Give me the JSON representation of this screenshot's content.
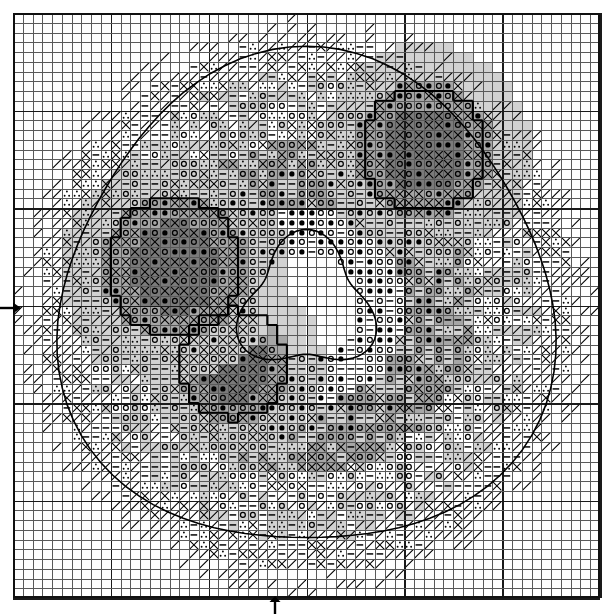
{
  "chart_data": {
    "type": "table",
    "grid": {
      "columns": 60,
      "rows": 60,
      "cell_px": 9.78,
      "bold_every": 10
    },
    "symbol_legend": [
      {
        "key": "blank",
        "glyph": "",
        "name": "empty-stitch"
      },
      {
        "key": "dash",
        "glyph": "—",
        "name": "dash-symbol"
      },
      {
        "key": "circle",
        "glyph": "○",
        "name": "open-circle-symbol"
      },
      {
        "key": "dot",
        "glyph": "●",
        "name": "filled-circle-symbol"
      },
      {
        "key": "cross",
        "glyph": "✕",
        "name": "cross-symbol"
      },
      {
        "key": "slash",
        "glyph": "╱",
        "name": "slash-symbol"
      },
      {
        "key": "trio",
        "glyph": "∴",
        "name": "three-dot-symbol"
      }
    ],
    "shade_legend": [
      {
        "key": 0,
        "hex": "#ffffff",
        "name": "white-background"
      },
      {
        "key": 1,
        "hex": "#d2d2d2",
        "name": "light-gray-background"
      },
      {
        "key": 2,
        "hex": "#a6a6a6",
        "name": "medium-gray-background"
      },
      {
        "key": 3,
        "hex": "#7a7a7a",
        "name": "dark-gray-background"
      }
    ],
    "markers": [
      {
        "name": "center-row-arrow",
        "direction": "right",
        "edge": "left",
        "row": 30
      },
      {
        "name": "center-column-arrow",
        "direction": "up",
        "edge": "bottom",
        "column": 27
      }
    ],
    "colors": {
      "grid_line": "#5a5a5a",
      "bold_grid_line": "#1a1a1a",
      "border": "#111111",
      "symbol": "#000000"
    },
    "rows": [
      "............................................................",
      "..................d.d.d.......ccc.cc........................",
      "................1d1d1d-.......cc.cc.c.......................",
      "...............1-1-1-1-..xxxxxx..ccc........................",
      ".............ooooo--1--1.xxxxx..xxx-........................",
      "............oooooo-1-1..xxx.xxx.xx-.........................",
      "..........ooooox-1-1-1.xx.xxx..xx-1-........................",
      "........--xxxxxx---ttt.xx.xx...x-1-1........................",
      "........----1---tttttt.x......-1-1-1........................",
      ".......-dd---1-ttttttt.......1-1-1-1........................",
      "......d-1-1-1-tttttttxx....xxoxoxox1........................",
      ".....d-1-1-1-1ttttttxxxx..xxxoooooox........................",
      ".....d-1-ooo1-1tttt.xxxxxooooooooooxx.......................",
      "....o-1-ooooo1-1tt.xxxxooooooooooox-........................",
      "...oo1-oooooo1-1-.xxxooooooooooooxx-........................",
      "..ooo1-oooooo1-1..xxooooooooooooxx--........................",
      "..oo1-1ooooo1-1-.xxxoooooooooooxx--d........................",
      ".ox1-1-ooooo1-1.xxxxoooooooooxxx--dd........................",
      ".x1-1-1oooo1-1-.xxxxooooooooxxx--ddd........................",
      "x1-1-1-ooo1-1-..xxxxooooooxxx--dddddd.......................",
      "1-1-1-1oo1-1-...xxxxoooooxxx--ddddddd.......................",
      "-1-1-1oo1-1-....xxxoooooxx--dddddddd........................",
      "d-1-1oo1-1-....xxxoooooxx--ddddddd..........................",
      "dd1-oo1-1-....xxxooooxx--dddddddd...........................",
      "ddooo1-1-....xxxoooxx--ddddddddd............................",
      "dooo1-1-....xxxooxx--dddddddddd.............................",
      "ooo1-1-....xxxoxx--ddddddddddd..............................",
      "oo1-1-....xxxxx--dddddddddddd...............................",
      "o1-1-....xxxx--ddddddddddddd................................",
      "1-1-....xxx--dddddddddddddd.................................",
      "-1-....xx--ddddddddddddddd..................................",
      "1-....x--dddddddddddddddd...................................",
      "-....--ddddddddddddddddd....................................",
      "....--dddddddddddddddddd....................................",
      "...--ddddddddddddddddddd....................................",
      "..--dddddddddddddddddddd....................................",
      ".--ddddddddddddddddddddd....................................",
      "--dddddddddddddddddddddd....................................",
      "-ddddddddddddddddddddddd....................................",
      "ddddddddddddddddddddddd.....................................",
      "dddddddddddddddddddddd......................................",
      "ddddddddddddddddddddd.......................................",
      "dddddddddddddddddddd........................................",
      "ddddddddddddddddddd.........................................",
      "dddddddddddddddddd..........................................",
      "ddddddddddddddddd...........................................",
      "dddddddddddddddd............................................",
      "ddddddddddddddd.............................................",
      "dddddddddddddd..............................................",
      "ddddddddddddd...............................................",
      "dddddddddddd................................................",
      "ddddddddddd.................................................",
      "dddddddddd..................................................",
      "ddddddddd...................................................",
      "dddddddd....................................................",
      "ddddddd.....................................................",
      "dddddd......................................................",
      "ddddd.......................................................",
      "dddd........................................................",
      "ddd........................................................."
    ]
  }
}
